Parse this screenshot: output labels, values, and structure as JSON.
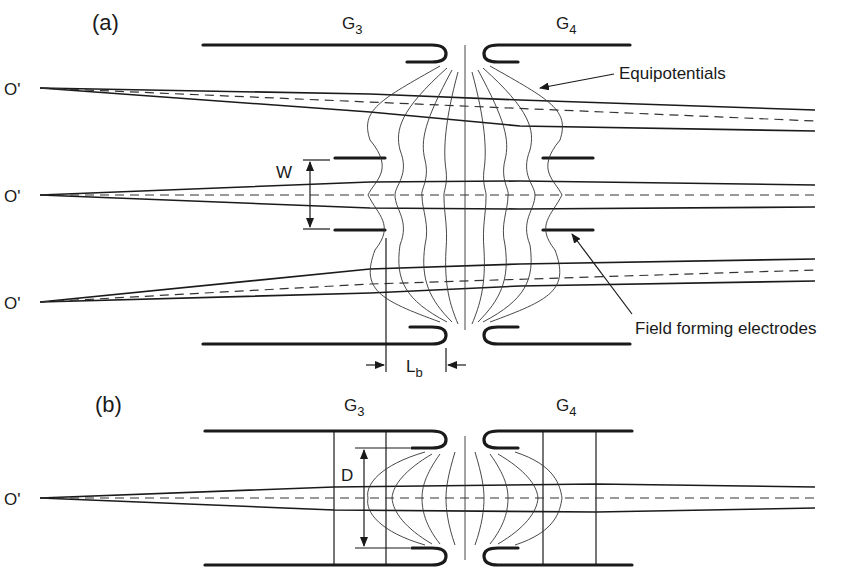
{
  "figure": {
    "panel_a": {
      "label": "(a)",
      "electrode_left": "G",
      "electrode_left_sub": "3",
      "electrode_right": "G",
      "electrode_right_sub": "4",
      "source_labels": [
        "O'",
        "O'",
        "O'"
      ],
      "dimension_w": "W",
      "dimension_lb": "L",
      "dimension_lb_sub": "b",
      "annotation_equipotentials": "Equipotentials",
      "annotation_field_forming": "Field forming electrodes"
    },
    "panel_b": {
      "label": "(b)",
      "electrode_left": "G",
      "electrode_left_sub": "3",
      "electrode_right": "G",
      "electrode_right_sub": "4",
      "source_label": "O'",
      "dimension_d": "D"
    }
  },
  "colors": {
    "ink": "#1a1a1a",
    "background": "#ffffff"
  }
}
